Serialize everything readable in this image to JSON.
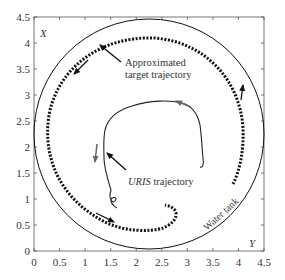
{
  "chart_data": {
    "type": "line",
    "title": "",
    "xlabel": "Y",
    "ylabel": "X",
    "xlim": [
      0,
      4.5
    ],
    "ylim": [
      0,
      4.5
    ],
    "grid": false,
    "x_ticks": [
      "0",
      "0.5",
      "1",
      "1.5",
      "2",
      "2.5",
      "3",
      "3.5",
      "4",
      "4.5"
    ],
    "y_ticks": [
      "0",
      "0.5",
      "1",
      "1.5",
      "2",
      "2.5",
      "3",
      "3.5",
      "4",
      "4.5"
    ],
    "series": [
      {
        "name": "Water tank",
        "style": "solid circle",
        "center": [
          2.25,
          2.25
        ],
        "radius": 2.25
      },
      {
        "name": "Approximated target trajectory",
        "style": "dotted",
        "shape": "near-circle, radius approx 2.0, counter-clockwise, ends in hook near (2.7, 0.55)"
      },
      {
        "name": "URIS trajectory",
        "style": "solid thin",
        "points": [
          [
            1.55,
            0.8
          ],
          [
            1.45,
            0.95
          ],
          [
            1.5,
            1.05
          ],
          [
            1.65,
            0.9
          ],
          [
            1.5,
            1.2
          ],
          [
            1.35,
            1.5
          ],
          [
            1.35,
            1.9
          ],
          [
            1.3,
            2.2
          ],
          [
            1.55,
            2.75
          ],
          [
            2.0,
            2.95
          ],
          [
            2.6,
            2.95
          ],
          [
            3.0,
            2.7
          ],
          [
            3.15,
            2.35
          ],
          [
            3.3,
            1.9
          ],
          [
            3.35,
            1.75
          ],
          [
            3.25,
            1.8
          ]
        ]
      }
    ],
    "annotations": [
      {
        "text": "Approximated",
        "line2": "target trajectory"
      },
      {
        "text": "URIS",
        "suffix": " trajectory"
      },
      {
        "text": "Water tank"
      }
    ]
  },
  "labels": {
    "x_axis": "Y",
    "y_axis": "X",
    "target_line1": "Approximated",
    "target_line2": "target trajectory",
    "uris_italic": "URIS",
    "uris_rest": " trajectory",
    "tank": "Water tank"
  }
}
